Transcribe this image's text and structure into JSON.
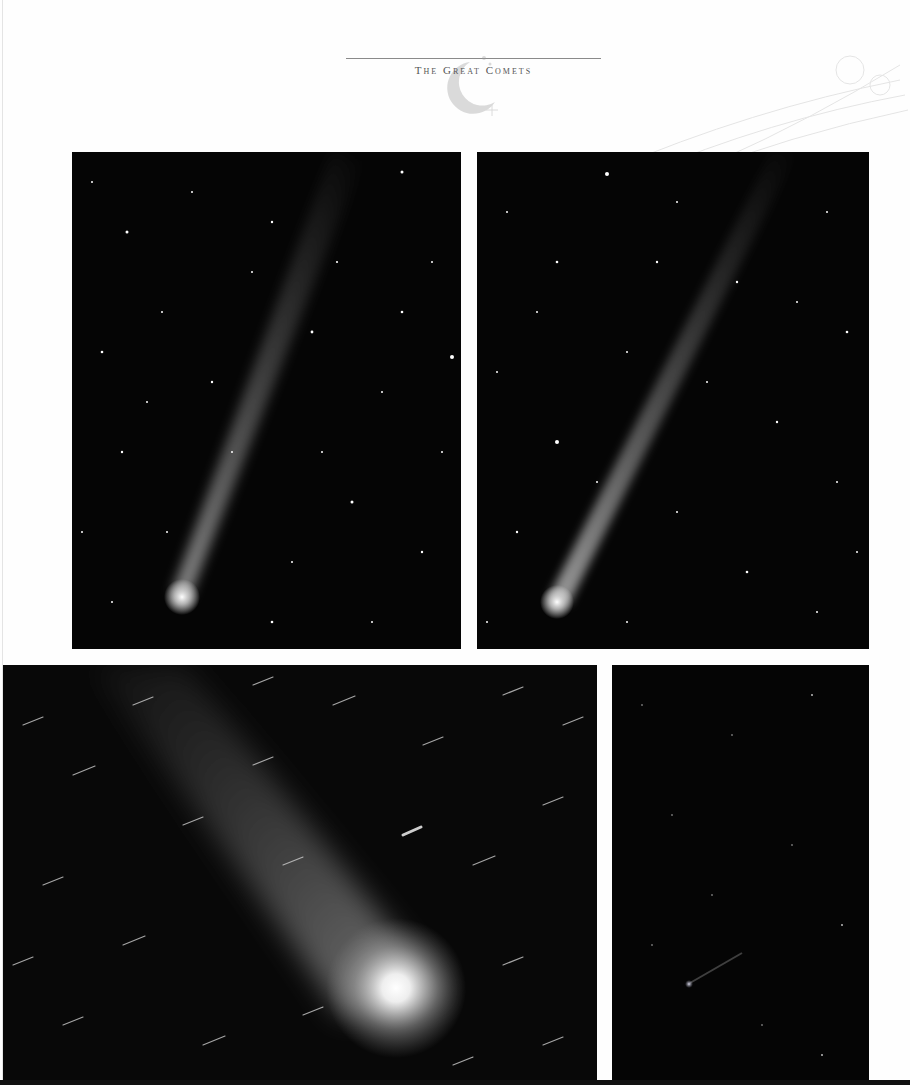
{
  "header": {
    "title": "The Great Comets",
    "ornament": "crescent-moon-ornament"
  },
  "photos": [
    {
      "id": "comet-photo-top-left",
      "description": "Comet with long faint tail, nucleus lower-left, starfield"
    },
    {
      "id": "comet-photo-top-right",
      "description": "Comet with long narrow tail, nucleus lower-left, starfield"
    },
    {
      "id": "comet-photo-bottom-left",
      "description": "Close-up comet with bright coma and trailed star streaks"
    },
    {
      "id": "comet-photo-bottom-right",
      "description": "Small distant comet in dark starfield"
    }
  ],
  "colors": {
    "page": "#fefefe",
    "sky": "#050505",
    "rule": "#8a8a8a"
  }
}
